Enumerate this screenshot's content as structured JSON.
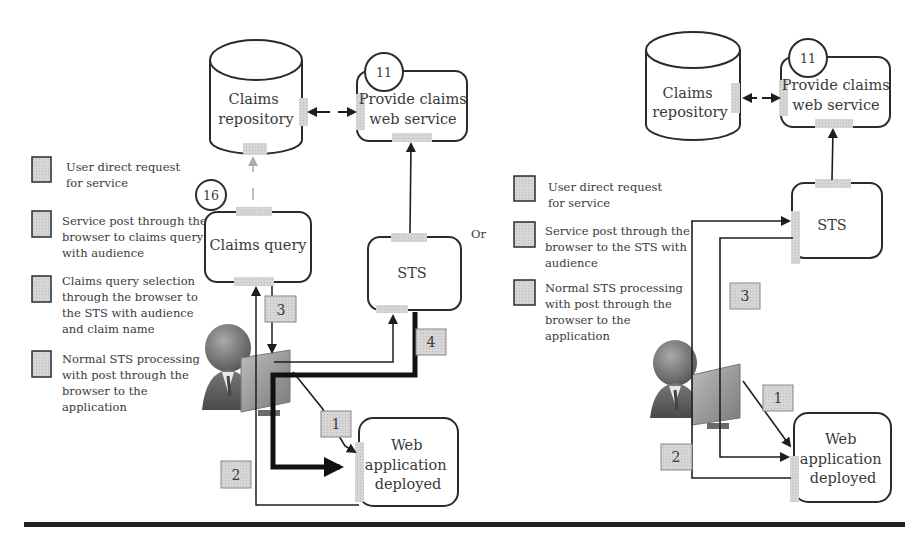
{
  "left_panel": {
    "legend": [
      {
        "lines": [
          "User direct request",
          "for service"
        ]
      },
      {
        "lines": [
          "Service post through the",
          "browser to claims query",
          "with audience"
        ]
      },
      {
        "lines": [
          "Claims query selection",
          "through the browser to",
          "the STS with audience",
          "and claim name"
        ]
      },
      {
        "lines": [
          "Normal STS processing",
          "with post through the",
          "browser to the",
          "application"
        ]
      }
    ],
    "nodes": {
      "repository": {
        "lines": [
          "Claims",
          "repository"
        ]
      },
      "claims_service": {
        "lines": [
          "Provide claims",
          "web service"
        ],
        "badge": "11"
      },
      "claims_query": {
        "lines": [
          "Claims query"
        ],
        "badge": "16"
      },
      "sts": {
        "lines": [
          "STS"
        ]
      },
      "web_app": {
        "lines": [
          "Web",
          "application",
          "deployed"
        ]
      }
    },
    "steps": [
      "1",
      "2",
      "3",
      "4"
    ]
  },
  "separator_text": "Or",
  "right_panel": {
    "legend": [
      {
        "lines": [
          "User direct request",
          "for service"
        ]
      },
      {
        "lines": [
          "Service post through the",
          "browser to the STS with",
          "audience"
        ]
      },
      {
        "lines": [
          "Normal STS processing",
          "with post through the",
          "browser to the",
          "application"
        ]
      }
    ],
    "nodes": {
      "repository": {
        "lines": [
          "Claims",
          "repository"
        ]
      },
      "claims_service": {
        "lines": [
          "Provide claims",
          "web service"
        ],
        "badge": "11"
      },
      "sts": {
        "lines": [
          "STS"
        ]
      },
      "web_app": {
        "lines": [
          "Web",
          "application",
          "deployed"
        ]
      }
    },
    "steps": [
      "1",
      "2",
      "3"
    ]
  },
  "colors": {
    "stroke": "#2b2b2b",
    "port_fill": "#d4d4d4",
    "legend_box_fill": "#d0d0d0",
    "text": "#3a3a3a"
  }
}
